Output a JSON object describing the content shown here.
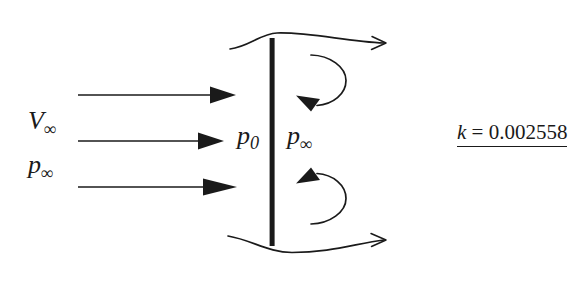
{
  "figure": {
    "type": "flow-past-flat-plate-diagram",
    "background_color": "#ffffff",
    "ink_color": "#1a1a1a"
  },
  "labels": {
    "freestream_velocity": {
      "symbol": "V",
      "subscript": "∞"
    },
    "freestream_pressure": {
      "symbol": "p",
      "subscript": "∞"
    },
    "stagnation_pressure": {
      "symbol": "p",
      "subscript": "0"
    },
    "wake_pressure": {
      "symbol": "p",
      "subscript": "∞"
    },
    "coefficient": {
      "variable": "k",
      "equals": " = ",
      "value": "0.002558"
    }
  },
  "geometry": {
    "plate": {
      "x": 272,
      "y_top": 38,
      "y_bottom": 246,
      "thickness": 5
    },
    "inflow_arrows": [
      {
        "x1": 78,
        "y": 95,
        "x2": 235
      },
      {
        "x1": 78,
        "y": 141,
        "x2": 224
      },
      {
        "x1": 78,
        "y": 187,
        "x2": 237
      }
    ],
    "streamlines": [
      {
        "name": "upper",
        "path": "M 230 49 C 250 46 262 33 277 33 C 310 33 345 42 382 43"
      },
      {
        "name": "lower",
        "path": "M 228 236 C 252 240 268 252 292 252 C 330 252 355 243 382 240"
      }
    ],
    "vortices": [
      {
        "name": "upper-vortex",
        "cx": 320,
        "cy": 79,
        "r": 26,
        "rotation": "clockwise"
      },
      {
        "name": "lower-vortex",
        "cx": 320,
        "cy": 199,
        "r": 26,
        "rotation": "counter-clockwise"
      }
    ]
  }
}
